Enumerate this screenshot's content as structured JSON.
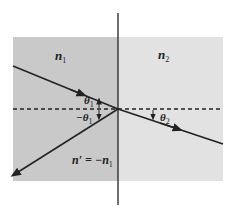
{
  "diagram": {
    "regions": {
      "left": {
        "label": "n",
        "subscript": "1",
        "color": "#c9c9c9"
      },
      "right": {
        "label": "n",
        "subscript": "2",
        "color": "#e2e2e2"
      }
    },
    "labels": {
      "theta1": {
        "symbol": "θ",
        "subscript": "1"
      },
      "neg_theta1": {
        "symbol": "−θ",
        "subscript": "1"
      },
      "theta2": {
        "symbol": "θ",
        "subscript": "2"
      },
      "n_prime": {
        "text": "n′ = −n",
        "subscript": "1"
      }
    },
    "rays": [
      {
        "name": "incident-ray",
        "description": "from upper-left to interface point"
      },
      {
        "name": "reflected-ray",
        "description": "from interface point to lower-left"
      },
      {
        "name": "refracted-ray",
        "description": "from interface point to lower-right"
      }
    ],
    "colors": {
      "line": "#222222"
    }
  }
}
